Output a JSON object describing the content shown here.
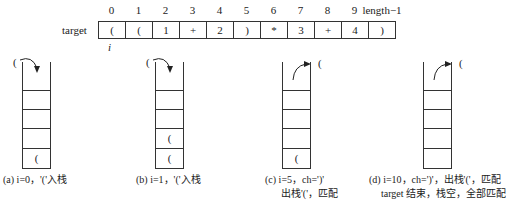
{
  "array": {
    "label": "target",
    "indices": [
      "0",
      "1",
      "2",
      "3",
      "4",
      "5",
      "6",
      "7",
      "8",
      "9",
      "length−1"
    ],
    "cells": [
      "(",
      "(",
      "1",
      "+",
      "2",
      ")",
      "*",
      "3",
      "+",
      "4",
      ")"
    ],
    "pointer": "i"
  },
  "stacks": [
    {
      "id": "a",
      "slots_bottom_up": [
        "(",
        "",
        "",
        "",
        ""
      ],
      "moving_char": "(",
      "action": "push",
      "caption_line1": "(a) i=0，'('入栈",
      "caption_line2": ""
    },
    {
      "id": "b",
      "slots_bottom_up": [
        "(",
        "(",
        "",
        "",
        ""
      ],
      "moving_char": "(",
      "action": "push",
      "caption_line1": "(b) i=1，'('入栈",
      "caption_line2": ""
    },
    {
      "id": "c",
      "slots_bottom_up": [
        "(",
        "",
        "",
        "",
        ""
      ],
      "moving_char": "(",
      "action": "pop",
      "caption_line1": "(c) i=5，ch=')'",
      "caption_line2": "出栈'('，匹配"
    },
    {
      "id": "d",
      "slots_bottom_up": [
        "",
        "",
        "",
        "",
        ""
      ],
      "moving_char": "(",
      "action": "pop",
      "caption_line1": "(d) i=10，ch=')'，出栈'('，匹配",
      "caption_line2": "target 结束，栈空，全部匹配"
    }
  ]
}
